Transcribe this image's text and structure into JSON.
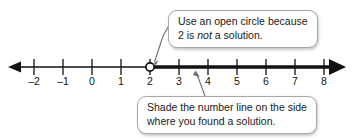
{
  "figure": {
    "background_color": "#ffffff",
    "line_color": "#111111",
    "callout_border_color": "#a8a8a8",
    "callout_fill_color": "#ffffff",
    "text_color": "#1a1a1a"
  },
  "number_line": {
    "min": -2,
    "max": 8,
    "ticks": [
      -2,
      -1,
      0,
      1,
      2,
      3,
      4,
      5,
      6,
      7,
      8
    ],
    "tick_labels": [
      "–2",
      "–1",
      "0",
      "1",
      "2",
      "3",
      "4",
      "5",
      "6",
      "7",
      "8"
    ],
    "left_arrow": true,
    "right_arrow": true,
    "left_arrow_weight": "thin",
    "right_arrow_weight": "thick",
    "endpoint": {
      "value": 2,
      "style": "open-circle",
      "filled": false
    },
    "shaded_ray": {
      "from": 2,
      "direction": "right",
      "to_infinity": true,
      "weight": "thick"
    }
  },
  "callouts": [
    {
      "id": "open-circle",
      "line1": "Use an open circle because",
      "line2_before": "2 is ",
      "line2_emphasis": "not",
      "line2_after": " a solution.",
      "points_to": "open-circle-at-2"
    },
    {
      "id": "shade",
      "line1": "Shade the number line on the side",
      "line2": "where you found a solution.",
      "points_to": "shaded-ray"
    }
  ]
}
